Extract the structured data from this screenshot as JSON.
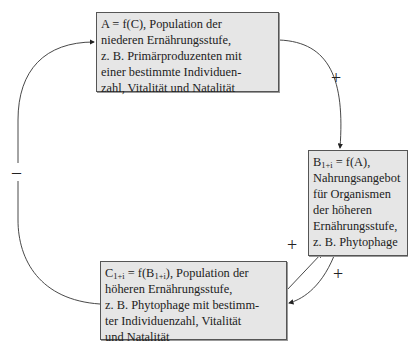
{
  "diagram": {
    "nodes": {
      "a": {
        "lines": [
          "A = f(C), Population der",
          "niederen Ernährungsstufe,",
          "z. B. Primärproduzenten mit",
          "einer bestimmte Individuen-",
          "zahl, Vitalität und Natalität"
        ]
      },
      "b": {
        "formula_main": "B",
        "formula_sub": "1+i",
        "formula_rest": " = f(A),",
        "lines": [
          "Nahrungsangebot",
          "für Organismen",
          "der höheren",
          "Ernährungsstufe,",
          "z. B. Phytophage"
        ]
      },
      "c": {
        "formula_main": "C",
        "formula_sub": "1+i",
        "formula_mid": " = f(B",
        "formula_sub2": "1+i",
        "formula_rest": "), Population der",
        "lines": [
          "höheren Ernährungsstufe,",
          "z. B. Phytophage mit bestimm-",
          "ter Individuenzahl, Vitalität",
          "und Natalität"
        ]
      }
    },
    "edges": {
      "a_to_b": {
        "sign": "+"
      },
      "c_to_b": {
        "sign": "+"
      },
      "b_to_c": {
        "sign": "+"
      },
      "c_to_a": {
        "sign": "–"
      }
    }
  }
}
